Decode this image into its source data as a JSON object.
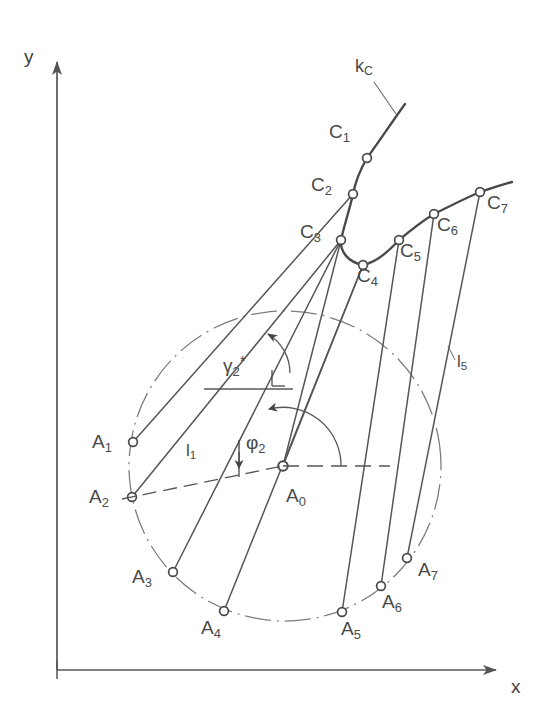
{
  "figure": {
    "kind": "geometric-construction-diagram",
    "background": "#ffffff",
    "ink_color": "#565656",
    "axes": {
      "x_label": "x",
      "y_label": "y",
      "origin": {
        "x": 57,
        "y": 670
      },
      "x_end": {
        "x": 506,
        "y": 670
      },
      "y_end": {
        "x": 57,
        "y": 52
      }
    },
    "curve": {
      "name_label": "k",
      "name_sub": "C",
      "label_pos": {
        "x": 360,
        "y": 57
      },
      "leader_from": {
        "x": 375,
        "y": 80
      },
      "leader_to": {
        "x": 395,
        "y": 113
      }
    },
    "center_point": {
      "id": "A0",
      "label": "A",
      "sub": "0",
      "x": 283,
      "y": 466,
      "label_pos": {
        "x": 290,
        "y": 490
      }
    },
    "a_points": [
      {
        "id": "A1",
        "label": "A",
        "sub": "1",
        "x": 133,
        "y": 442,
        "label_pos": {
          "x": 96,
          "y": 432
        }
      },
      {
        "id": "A2",
        "label": "A",
        "sub": "2",
        "x": 132,
        "y": 497,
        "label_pos": {
          "x": 93,
          "y": 487
        }
      },
      {
        "id": "A3",
        "label": "A",
        "sub": "3",
        "x": 173,
        "y": 572,
        "label_pos": {
          "x": 136,
          "y": 572
        }
      },
      {
        "id": "A4",
        "label": "A",
        "sub": "4",
        "x": 224,
        "y": 611,
        "label_pos": {
          "x": 205,
          "y": 622
        }
      },
      {
        "id": "A5",
        "label": "A",
        "sub": "5",
        "x": 342,
        "y": 612,
        "label_pos": {
          "x": 345,
          "y": 623
        }
      },
      {
        "id": "A6",
        "label": "A",
        "sub": "6",
        "x": 381,
        "y": 586,
        "label_pos": {
          "x": 386,
          "y": 596
        }
      },
      {
        "id": "A7",
        "label": "A",
        "sub": "7",
        "x": 407,
        "y": 558,
        "label_pos": {
          "x": 422,
          "y": 565
        }
      }
    ],
    "c_points": [
      {
        "id": "C1",
        "label": "C",
        "sub": "1",
        "x": 367,
        "y": 158,
        "label_pos": {
          "x": 334,
          "y": 128
        }
      },
      {
        "id": "C2",
        "label": "C",
        "sub": "2",
        "x": 353,
        "y": 194,
        "label_pos": {
          "x": 316,
          "y": 183
        }
      },
      {
        "id": "C3",
        "label": "C",
        "sub": "3",
        "x": 341,
        "y": 240,
        "label_pos": {
          "x": 306,
          "y": 230
        }
      },
      {
        "id": "C4",
        "label": "C",
        "sub": "4",
        "x": 363,
        "y": 265,
        "label_pos": {
          "x": 363,
          "y": 270
        }
      },
      {
        "id": "C5",
        "label": "C",
        "sub": "5",
        "x": 399,
        "y": 240,
        "label_pos": {
          "x": 404,
          "y": 245
        }
      },
      {
        "id": "C6",
        "label": "C",
        "sub": "6",
        "x": 434,
        "y": 214,
        "label_pos": {
          "x": 441,
          "y": 220
        }
      },
      {
        "id": "C7",
        "label": "C",
        "sub": "7",
        "x": 480,
        "y": 192,
        "label_pos": {
          "x": 490,
          "y": 198
        }
      }
    ],
    "links": [
      {
        "from": "A1",
        "to": "C2"
      },
      {
        "from": "A2",
        "to": "C3"
      },
      {
        "from": "A3",
        "to": "C3"
      },
      {
        "from": "A4",
        "to": "C4"
      },
      {
        "from": "A5",
        "to": "C5"
      },
      {
        "from": "A6",
        "to": "C6"
      },
      {
        "from": "A7",
        "to": "C7"
      },
      {
        "from": "A0",
        "to": "C3"
      },
      {
        "from": "A0",
        "to": "C4"
      }
    ],
    "dimensions": [
      {
        "id": "l1",
        "label": "l",
        "sub": "1",
        "label_pos": {
          "x": 189,
          "y": 443
        },
        "line_from": {
          "x": 132,
          "y": 497
        },
        "line_to": {
          "x": 283,
          "y": 466
        }
      },
      {
        "id": "l5",
        "label": "l",
        "sub": "5",
        "label_pos": {
          "x": 460,
          "y": 352
        }
      }
    ],
    "angles": [
      {
        "id": "gamma2star",
        "label": "γ",
        "sub": "2",
        "sup": "*",
        "label_pos": {
          "x": 228,
          "y": 356
        },
        "ref_line_from": {
          "x": 205,
          "y": 389
        },
        "ref_line_to": {
          "x": 292,
          "y": 389
        },
        "arc_note": "arc from horizontal reference up to A0-C3 direction, arrowhead at top",
        "right_angle_mark": {
          "x": 272,
          "y": 376
        }
      },
      {
        "id": "phi2",
        "label": "φ",
        "sub": "2",
        "label_pos": {
          "x": 251,
          "y": 437
        },
        "vertex": {
          "x": 283,
          "y": 466
        },
        "ref_line_from": {
          "x": 283,
          "y": 466
        },
        "ref_line_to": {
          "x": 380,
          "y": 466
        },
        "arc_radius": 58,
        "arc_note": "semicircular arc from +x direction counterclockwise to A0-C3 ray, arrowhead at end"
      }
    ],
    "pitch_ellipse": {
      "note": "dash-dot construction ellipse through the A points",
      "cx": 285,
      "cy": 466,
      "rx": 156,
      "ry": 155,
      "rotation_deg": -8
    }
  }
}
